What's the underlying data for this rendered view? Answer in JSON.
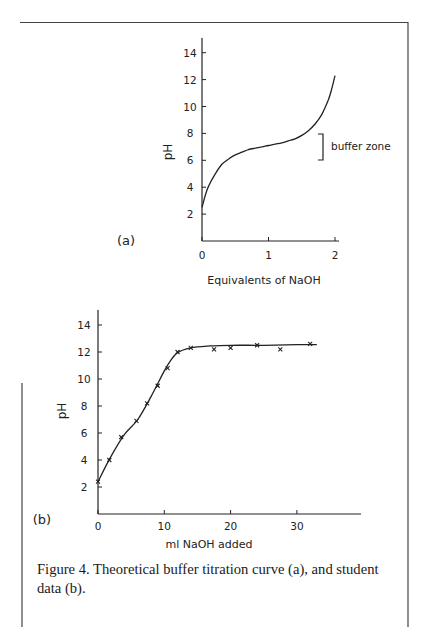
{
  "caption": "Figure 4. Theoretical buffer titration curve (a), and student data (b).",
  "chart_data": [
    {
      "type": "line",
      "panel_label": "(a)",
      "title": "",
      "xlabel": "Equivalents of NaOH",
      "ylabel": "pH",
      "xlim": [
        0,
        2
      ],
      "ylim": [
        0,
        14
      ],
      "x_ticks": [
        "0",
        "1",
        "2"
      ],
      "y_ticks": [
        "2",
        "4",
        "6",
        "8",
        "10",
        "12",
        "14"
      ],
      "grid": false,
      "annotations": [
        {
          "text": "buffer zone",
          "y_range": [
            6,
            8
          ],
          "style": "bracket"
        }
      ],
      "series": [
        {
          "name": "Theoretical curve",
          "x": [
            0,
            0.05,
            0.1,
            0.2,
            0.3,
            0.4,
            0.5,
            0.6,
            0.7,
            0.8,
            0.9,
            1.0,
            1.1,
            1.2,
            1.3,
            1.4,
            1.5,
            1.6,
            1.7,
            1.8,
            1.9,
            1.95,
            2.0
          ],
          "values": [
            2.5,
            3.4,
            4.1,
            5.0,
            5.7,
            6.1,
            6.4,
            6.6,
            6.8,
            6.9,
            7.0,
            7.1,
            7.2,
            7.3,
            7.45,
            7.6,
            7.85,
            8.2,
            8.7,
            9.4,
            10.5,
            11.3,
            12.3
          ]
        }
      ]
    },
    {
      "type": "scatter",
      "panel_label": "(b)",
      "title": "",
      "xlabel": "ml NaOH added",
      "ylabel": "pH",
      "xlim": [
        0,
        40
      ],
      "ylim": [
        0,
        15
      ],
      "x_ticks": [
        "0",
        "10",
        "20",
        "30"
      ],
      "y_ticks": [
        "2",
        "4",
        "6",
        "8",
        "10",
        "12",
        "14"
      ],
      "grid": false,
      "series": [
        {
          "name": "Student data",
          "marker": "x",
          "x": [
            0,
            1.7,
            3.5,
            5.8,
            7.4,
            9.0,
            10.5,
            12.0,
            14.0,
            17.5,
            20.0,
            24.0,
            27.5,
            32.0
          ],
          "values": [
            2.4,
            4.0,
            5.7,
            6.9,
            8.2,
            9.5,
            10.8,
            12.0,
            12.3,
            12.2,
            12.3,
            12.5,
            12.2,
            12.6
          ]
        },
        {
          "name": "Fitted curve",
          "x": [
            0,
            2,
            4,
            6,
            8,
            10,
            11,
            12,
            14,
            17,
            20,
            25,
            30,
            33
          ],
          "values": [
            2.4,
            4.3,
            5.9,
            7.0,
            8.7,
            10.6,
            11.4,
            11.95,
            12.3,
            12.45,
            12.5,
            12.5,
            12.55,
            12.55
          ]
        }
      ]
    }
  ]
}
